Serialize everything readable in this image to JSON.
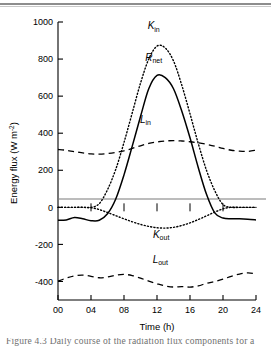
{
  "figure": {
    "background_color": "#ffffff",
    "ink_color": "#000000",
    "rule_color": "#8d8d8d",
    "caption_fragment": "Figure 4.3  Daily course of the radiation flux components for a",
    "caption_color": "#6f6f6f"
  },
  "chart_data": {
    "type": "line",
    "title": "",
    "xlabel": "Time (h)",
    "ylabel": "Energy flux (W m⁻²)",
    "xlim": [
      0,
      24
    ],
    "ylim": [
      -500,
      1000
    ],
    "xticks": [
      0,
      4,
      8,
      12,
      16,
      20,
      24
    ],
    "xticklabels": [
      "00",
      "04",
      "08",
      "12",
      "16",
      "20",
      "24"
    ],
    "yticks": [
      1000,
      800,
      600,
      400,
      200,
      0,
      -200,
      -400
    ],
    "yticklabels": [
      "1000",
      "800",
      "600",
      "400",
      "200",
      "0",
      "-200",
      "-400"
    ],
    "grid": false,
    "legend": "inline-labels",
    "zero_line": true,
    "zero_line_color": "#7a7a7a",
    "x": [
      0,
      1,
      2,
      3,
      4,
      5,
      6,
      7,
      8,
      9,
      10,
      11,
      12,
      13,
      14,
      15,
      16,
      17,
      18,
      19,
      20,
      21,
      22,
      23,
      24
    ],
    "series": [
      {
        "name": "K_in",
        "label_main": "K",
        "label_sub": "in",
        "style": "dotted",
        "color": "#000000",
        "peak_value": 875,
        "peak_time": 12,
        "values": [
          0,
          0,
          0,
          0,
          0,
          20,
          95,
          205,
          350,
          510,
          670,
          800,
          870,
          860,
          790,
          660,
          505,
          345,
          200,
          90,
          15,
          0,
          0,
          0,
          0
        ]
      },
      {
        "name": "R_net",
        "label_main": "R",
        "label_sub": "net",
        "style": "solid",
        "color": "#000000",
        "peak_value": 715,
        "peak_time": 12,
        "night_value": -65,
        "values": [
          -70,
          -68,
          -55,
          -62,
          -72,
          -70,
          -35,
          45,
          175,
          330,
          490,
          640,
          712,
          700,
          640,
          520,
          375,
          215,
          70,
          -30,
          -58,
          -62,
          -62,
          -64,
          -68
        ]
      },
      {
        "name": "L_in",
        "label_main": "L",
        "label_sub": "in",
        "style": "dashed",
        "color": "#000000",
        "min_value": 285,
        "max_value": 362,
        "values": [
          312,
          308,
          300,
          294,
          288,
          287,
          290,
          296,
          305,
          318,
          332,
          345,
          353,
          358,
          360,
          358,
          354,
          348,
          340,
          330,
          318,
          308,
          303,
          302,
          308
        ]
      },
      {
        "name": "K_out",
        "label_main": "K",
        "label_sub": "out",
        "style": "dotted",
        "color": "#000000",
        "min_value": -112,
        "min_time": 13,
        "values": [
          0,
          0,
          0,
          0,
          -2,
          -12,
          -28,
          -45,
          -62,
          -78,
          -92,
          -103,
          -110,
          -112,
          -108,
          -98,
          -84,
          -66,
          -46,
          -26,
          -8,
          0,
          0,
          0,
          0
        ]
      },
      {
        "name": "L_out",
        "label_main": "L",
        "label_sub": "out",
        "style": "dashed",
        "color": "#000000",
        "min_value": -432,
        "max_value": -352,
        "values": [
          -398,
          -382,
          -370,
          -366,
          -372,
          -380,
          -376,
          -366,
          -362,
          -368,
          -382,
          -398,
          -412,
          -424,
          -430,
          -428,
          -430,
          -424,
          -410,
          -400,
          -388,
          -372,
          -360,
          -354,
          -358
        ]
      }
    ],
    "annotations": [
      {
        "name": "K_in-label",
        "text_main": "K",
        "text_sub": "in",
        "x": 11.6,
        "y": 960
      },
      {
        "name": "R_net-label",
        "text_main": "R",
        "text_sub": "net",
        "x": 11.6,
        "y": 790
      },
      {
        "name": "L_in-label",
        "text_main": "L",
        "text_sub": "in",
        "x": 10.6,
        "y": 455
      },
      {
        "name": "K_out-label",
        "text_main": "K",
        "text_sub": "out",
        "x": 12.5,
        "y": -165
      },
      {
        "name": "L_out-label",
        "text_main": "L",
        "text_sub": "out",
        "x": 12.4,
        "y": -300
      }
    ]
  }
}
